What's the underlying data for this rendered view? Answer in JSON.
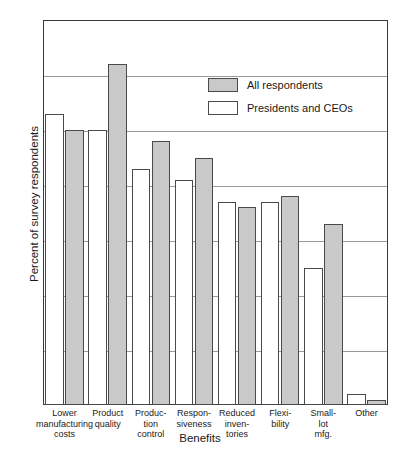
{
  "chart_data": {
    "type": "bar",
    "title": "",
    "xlabel": "Benefits",
    "ylabel": "Percent of survey respondents",
    "ylim": [
      0,
      70
    ],
    "yticks": [
      0,
      10,
      20,
      30,
      40,
      50,
      60,
      70
    ],
    "grid": true,
    "legend_position": "upper-right-inside",
    "categories": [
      "Lower\nmanufacturing\ncosts",
      "Product\nquality",
      "Produc-\ntion\ncontrol",
      "Respon-\nsiveness",
      "Reduced\ninven-\ntories",
      "Flexi-\nbility",
      "Small-\nlot\nmfg.",
      "Other"
    ],
    "category_lines": [
      [
        "Lower",
        "manufacturing",
        "costs"
      ],
      [
        "Product",
        "quality"
      ],
      [
        "Produc-",
        "tion",
        "control"
      ],
      [
        "Respon-",
        "siveness"
      ],
      [
        "Reduced",
        "inven-",
        "tories"
      ],
      [
        "Flexi-",
        "bility"
      ],
      [
        "Small-",
        "lot",
        "mfg."
      ],
      [
        "Other"
      ]
    ],
    "series": [
      {
        "name": "Presidents and CEOs",
        "color": "#ffffff",
        "values": [
          53,
          50,
          43,
          41,
          37,
          37,
          25,
          2
        ]
      },
      {
        "name": "All respondents",
        "color": "#c9c9c9",
        "values": [
          50,
          62,
          48,
          45,
          36,
          38,
          33,
          1
        ]
      }
    ],
    "series_draw_order": [
      "Presidents and CEOs",
      "All respondents"
    ]
  },
  "legend": {
    "items": [
      {
        "label": "All respondents",
        "swatch": "gray-filled-swatch"
      },
      {
        "label": "Presidents and CEOs",
        "swatch": "white-filled-swatch"
      }
    ]
  },
  "axes": {
    "y_title": "Percent of survey respondents",
    "x_title": "Benefits",
    "y_tick_labels": [
      "70",
      "60",
      "50",
      "40",
      "30",
      "20",
      "10",
      "0"
    ]
  },
  "colors": {
    "all_respondents_fill": "#c9c9c9",
    "presidents_ceos_fill": "#ffffff",
    "bar_outline": "#4a4a4a",
    "frame": "#3a3a3a",
    "gridline": "#9a9a9a",
    "text": "#1a1a1a",
    "background": "#ffffff"
  }
}
